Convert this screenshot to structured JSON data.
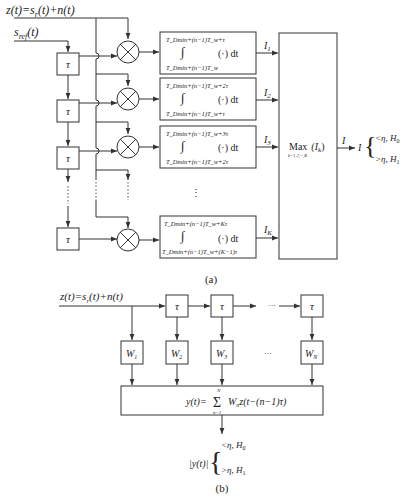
{
  "diagram_a": {
    "input_label": "z(t)=s",
    "input_label_sub": "r",
    "input_label_rest": "(t)+n(t)",
    "ref_label": "s",
    "ref_label_sub": "ref",
    "ref_label_rest": "(t)",
    "delay_symbol": "τ",
    "integrators": [
      {
        "upper": "T_Dmin+(n−1)T_w+τ",
        "lower": "T_Dmin+(n−1)T_w",
        "op": "(·) dt",
        "output": "I",
        "output_sub": "1"
      },
      {
        "upper": "T_Dmin+(n−1)T_w+2τ",
        "lower": "T_Dmin+(n−1)T_w+τ",
        "op": "(·) dt",
        "output": "I",
        "output_sub": "2"
      },
      {
        "upper": "T_Dmin+(n−1)T_w+3τ",
        "lower": "T_Dmin+(n−1)T_w+2τ",
        "op": "(·) dt",
        "output": "I",
        "output_sub": "3"
      },
      {
        "upper": "T_Dmin+(n−1)T_w+Kτ",
        "lower": "T_Dmin+(n−1)T_w+(K−1)τ",
        "op": "(·) dt",
        "output": "I",
        "output_sub": "K"
      }
    ],
    "max_block": {
      "label": "Max",
      "arg": "(I",
      "arg_sub": "k",
      "arg_end": ")",
      "range": "k=1,2,···,K"
    },
    "output_label": "I",
    "decision": {
      "var": "I",
      "case0": "<η, H",
      "case0_sub": "0",
      "case1": ">η, H",
      "case1_sub": "1"
    },
    "ellipsis": "⋮",
    "caption": "(a)"
  },
  "diagram_b": {
    "input_label": "z(t)=s",
    "input_label_sub": "r",
    "input_label_rest": "(t)+n(t)",
    "delay_symbol": "τ",
    "ellipsis": "···",
    "weights": [
      {
        "label": "W",
        "sub": "1"
      },
      {
        "label": "W",
        "sub": "2"
      },
      {
        "label": "W",
        "sub": "3"
      },
      {
        "label": "W",
        "sub": "N"
      }
    ],
    "sum_block": {
      "lhs": "y(t)=",
      "sigma": "Σ",
      "top": "N",
      "bottom": "n=1",
      "rhs": "W",
      "rhs_sub": "n",
      "rhs_rest": "z(t−(n−1)τ)"
    },
    "decision": {
      "var": "|y(t)|",
      "case0": "<η, H",
      "case0_sub": "0",
      "case1": ">η, H",
      "case1_sub": "1"
    },
    "caption": "(b)"
  }
}
